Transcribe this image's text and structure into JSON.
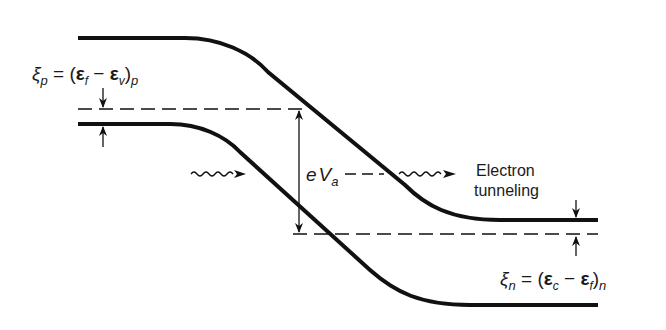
{
  "diagram": {
    "type": "band-diagram",
    "labels": {
      "xi_p_symbol": "ξ",
      "xi_p_sub": "p",
      "xi_p_eq": " = (",
      "xi_p_E1": "ε",
      "xi_p_E1_sub": "f",
      "xi_p_minus": " − ",
      "xi_p_E2": "ε",
      "xi_p_E2_sub": "v",
      "xi_p_close": ")",
      "xi_p_close_sub": "p",
      "xi_n_symbol": "ξ",
      "xi_n_sub": "n",
      "xi_n_eq": " = (",
      "xi_n_E1": "ε",
      "xi_n_E1_sub": "c",
      "xi_n_minus": " − ",
      "xi_n_E2": "ε",
      "xi_n_E2_sub": "f",
      "xi_n_close": ")",
      "xi_n_close_sub": "n",
      "eVa_e": "e",
      "eVa_V": "V",
      "eVa_sub": "a",
      "tunneling_line1": "Electron",
      "tunneling_line2": "tunneling"
    },
    "colors": {
      "stroke": "#111111",
      "background": "#ffffff"
    }
  }
}
